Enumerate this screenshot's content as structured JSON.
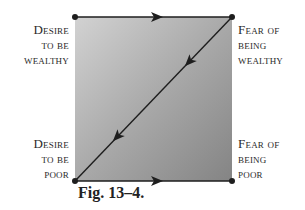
{
  "figure": {
    "caption": "Fig. 13–4.",
    "corners": {
      "top_left": {
        "lines": [
          "Desire",
          "to be",
          "wealthy"
        ]
      },
      "top_right": {
        "lines": [
          "Fear of",
          "being",
          "wealthy"
        ]
      },
      "bottom_left": {
        "lines": [
          "Desire",
          "to be",
          "poor"
        ]
      },
      "bottom_right": {
        "lines": [
          "Fear of",
          "being",
          "poor"
        ]
      }
    },
    "edges": [
      {
        "from": "top_left",
        "to": "top_right",
        "arrow": "right"
      },
      {
        "from": "top_right",
        "to": "bottom_left",
        "arrow": "down-left",
        "arrowheads": 2
      },
      {
        "from": "bottom_left",
        "to": "bottom_right",
        "arrow": "right"
      }
    ],
    "colors": {
      "fill_light": "#cfcfcf",
      "fill_dark": "#858585",
      "line": "#1e1e1e",
      "text": "#2a2a2a"
    }
  }
}
